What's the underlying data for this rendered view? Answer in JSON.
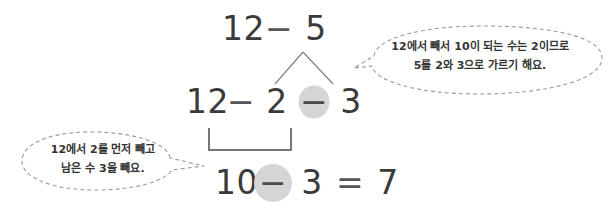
{
  "page": {
    "language": "ko",
    "background_color": "#ffffff",
    "text_color": "#3a3a3a",
    "circle_fill_color": "#d5d5d5",
    "bubble_outline_color": "#9a9a9a"
  },
  "equations": {
    "top": {
      "label": "12 - 5",
      "minuend": "12",
      "operator": "−",
      "subtrahend": "5"
    },
    "middle": {
      "label": "12 - 2 - 3",
      "minuend": "12",
      "operator1": "−",
      "part1": "2",
      "operator2": "−",
      "part2": "3"
    },
    "bottom": {
      "label": "10 - 3 = 7",
      "minuend": "10",
      "operator": "−",
      "subtrahend": "3",
      "equals": "=",
      "result": "7"
    }
  },
  "decomposition": {
    "whole": "5",
    "left_part": "2",
    "right_part": "3"
  },
  "bubbles": {
    "right": {
      "line1": "12에서 빼서 10이 되는 수는 2이므로",
      "line2": "5를 2와 3으로 가르기 해요."
    },
    "left": {
      "line1": "12에서 2를 먼저 빼고",
      "line2": "남은 수 3을 빼요."
    }
  }
}
